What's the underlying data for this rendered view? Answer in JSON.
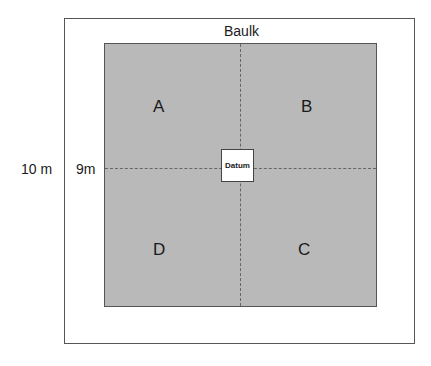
{
  "diagram": {
    "baulk_label": "Baulk",
    "outer_dimension_label": "10 m",
    "inner_dimension_label": "9m",
    "datum_label": "Datum",
    "quadrants": {
      "top_left": "A",
      "top_right": "B",
      "bottom_left": "D",
      "bottom_right": "C"
    },
    "colors": {
      "trench_fill": "#b9b9b9",
      "border": "#555555",
      "background": "#ffffff"
    }
  }
}
